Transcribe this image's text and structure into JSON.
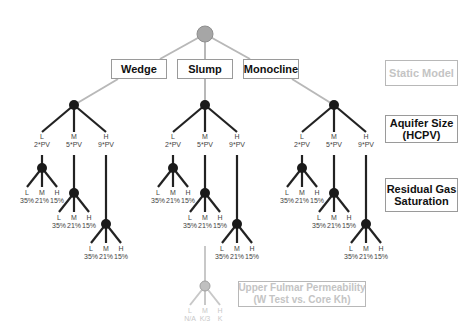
{
  "root": {
    "color": "#a6a6a6"
  },
  "models": [
    {
      "label": "Wedge",
      "x": 111,
      "w": 56
    },
    {
      "label": "Slump",
      "x": 177,
      "w": 56
    },
    {
      "label": "Monocline",
      "x": 243,
      "w": 56
    }
  ],
  "levels": [
    {
      "label": "Static Model",
      "faded": true
    },
    {
      "label": "Aquifer Size\n(HCPV)",
      "faded": false
    },
    {
      "label": "Residual Gas\nSaturation",
      "faded": false
    },
    {
      "label": "Upper Fulmar Permeability\n(W Test vs. Core Kh)",
      "faded": true
    }
  ],
  "aquifer_options": [
    {
      "level": "L",
      "value": "2*PV"
    },
    {
      "level": "M",
      "value": "5*PV"
    },
    {
      "level": "H",
      "value": "9*PV"
    }
  ],
  "sgr_options": [
    {
      "level": "L",
      "value": "35%"
    },
    {
      "level": "M",
      "value": "21%"
    },
    {
      "level": "H",
      "value": "15%"
    }
  ],
  "perm_options": [
    {
      "level": "L",
      "value": "N/A"
    },
    {
      "level": "M",
      "value": "K/3"
    },
    {
      "level": "H",
      "value": "K"
    }
  ],
  "colors": {
    "line_dark": "#222222",
    "line_light": "#b8b8b8",
    "node": "#1a1a1a",
    "text_faded": "#c4c4c4"
  }
}
